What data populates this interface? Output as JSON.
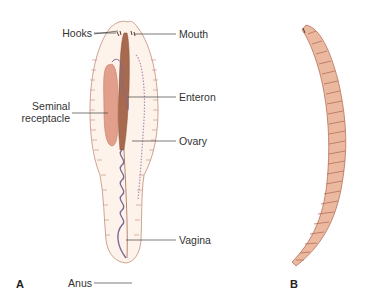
{
  "figure": {
    "panels": [
      {
        "id": "A",
        "label": "A",
        "subject": "leech-internal-anatomy"
      },
      {
        "id": "B",
        "label": "B",
        "subject": "leech-external-view"
      }
    ],
    "labels": {
      "hooks": "Hooks",
      "mouth": "Mouth",
      "seminal_1": "Seminal",
      "seminal_2": "receptacle",
      "enteron": "Enteron",
      "ovary": "Ovary",
      "vagina": "Vagina",
      "anus": "Anus"
    },
    "colors": {
      "body_fill": "#fdf3ea",
      "body_outline": "#c89a86",
      "enteron": "#a86a4e",
      "seminal_receptacle": "#e2a08c",
      "reproductive_duct": "#7a6a9a",
      "leader_line": "#444444",
      "worm_fill": "#eab9a0",
      "worm_shadow": "#b8705a"
    }
  }
}
